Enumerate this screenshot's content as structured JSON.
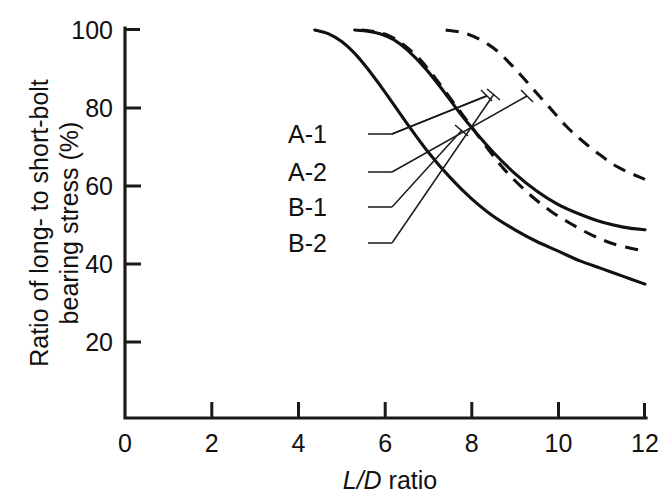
{
  "chart_data": {
    "type": "line",
    "title": "",
    "xlabel": "L/D ratio",
    "ylabel": "Ratio of long- to short-bolt bearing stress (%)",
    "ylabel_line1": "Ratio of long- to short-bolt",
    "ylabel_line2": "bearing stress (%)",
    "xlabel_italic_part": "L/D",
    "xlabel_plain_part": " ratio",
    "xlim": [
      0,
      12
    ],
    "ylim": [
      0,
      100
    ],
    "xticks": [
      0,
      2,
      4,
      6,
      8,
      10,
      12
    ],
    "xtick_labels": [
      "0",
      "2",
      "4",
      "6",
      "8",
      "10",
      "12"
    ],
    "yticks": [
      20,
      40,
      60,
      80,
      100
    ],
    "ytick_labels": [
      "20",
      "40",
      "60",
      "80",
      "100"
    ],
    "grid": false,
    "legend_position": "inside-left-callouts",
    "line_color": "#111111",
    "axis_color": "#1a1a1a",
    "series": [
      {
        "name": "A-1",
        "style": "solid",
        "points": [
          [
            4.38,
            100
          ],
          [
            4.7,
            99.0
          ],
          [
            5.0,
            97.0
          ],
          [
            5.3,
            94.0
          ],
          [
            5.6,
            90.0
          ],
          [
            6.0,
            84.0
          ],
          [
            6.5,
            76.0
          ],
          [
            7.0,
            68.5
          ],
          [
            7.5,
            62.0
          ],
          [
            8.0,
            56.5
          ],
          [
            8.5,
            52.0
          ],
          [
            9.0,
            48.5
          ],
          [
            9.5,
            45.5
          ],
          [
            10.0,
            43.0
          ],
          [
            10.5,
            40.5
          ],
          [
            11.0,
            38.5
          ],
          [
            11.5,
            36.5
          ],
          [
            12.0,
            34.5
          ]
        ]
      },
      {
        "name": "A-2",
        "style": "solid",
        "points": [
          [
            5.3,
            100
          ],
          [
            5.6,
            99.7
          ],
          [
            5.9,
            99.0
          ],
          [
            6.2,
            97.5
          ],
          [
            6.5,
            95.0
          ],
          [
            6.9,
            90.5
          ],
          [
            7.3,
            85.0
          ],
          [
            7.7,
            79.0
          ],
          [
            8.1,
            73.5
          ],
          [
            8.5,
            68.5
          ],
          [
            9.0,
            63.0
          ],
          [
            9.5,
            58.5
          ],
          [
            10.0,
            55.0
          ],
          [
            10.5,
            52.5
          ],
          [
            11.0,
            50.5
          ],
          [
            11.5,
            49.2
          ],
          [
            12.0,
            48.5
          ]
        ]
      },
      {
        "name": "B-1",
        "style": "dashed",
        "points": [
          [
            5.45,
            100
          ],
          [
            5.8,
            99.5
          ],
          [
            6.1,
            98.5
          ],
          [
            6.4,
            96.5
          ],
          [
            6.8,
            92.5
          ],
          [
            7.2,
            87.0
          ],
          [
            7.6,
            81.0
          ],
          [
            8.0,
            75.0
          ],
          [
            8.4,
            69.0
          ],
          [
            8.8,
            63.5
          ],
          [
            9.3,
            58.0
          ],
          [
            9.8,
            53.5
          ],
          [
            10.3,
            50.0
          ],
          [
            10.8,
            47.0
          ],
          [
            11.3,
            44.8
          ],
          [
            12.0,
            43.0
          ]
        ]
      },
      {
        "name": "B-2",
        "style": "dashed",
        "points": [
          [
            7.4,
            100
          ],
          [
            7.8,
            99.3
          ],
          [
            8.2,
            97.5
          ],
          [
            8.6,
            94.5
          ],
          [
            9.0,
            90.0
          ],
          [
            9.4,
            85.0
          ],
          [
            9.8,
            80.0
          ],
          [
            10.2,
            75.0
          ],
          [
            10.6,
            71.0
          ],
          [
            11.0,
            67.5
          ],
          [
            11.4,
            64.5
          ],
          [
            12.0,
            61.5
          ]
        ]
      }
    ],
    "callouts": [
      {
        "label": "A-1",
        "label_x": 0.0,
        "label_y": 0.0,
        "target_series": "A-1"
      },
      {
        "label": "A-2",
        "label_x": 0.0,
        "label_y": 0.0,
        "target_series": "A-2"
      },
      {
        "label": "B-1",
        "label_x": 0.0,
        "label_y": 0.0,
        "target_series": "B-1"
      },
      {
        "label": "B-2",
        "label_x": 0.0,
        "label_y": 0.0,
        "target_series": "B-2"
      }
    ]
  },
  "labels": {
    "series_a1": "A-1",
    "series_a2": "A-2",
    "series_b1": "B-1",
    "series_b2": "B-2",
    "x_tick_0": "0",
    "x_tick_1": "2",
    "x_tick_2": "4",
    "x_tick_3": "6",
    "x_tick_4": "8",
    "x_tick_5": "10",
    "x_tick_6": "12",
    "y_tick_0": "20",
    "y_tick_1": "40",
    "y_tick_2": "60",
    "y_tick_3": "80",
    "y_tick_4": "100",
    "y_axis_line1": "Ratio of long- to short-bolt",
    "y_axis_line2": "bearing stress (%)",
    "x_axis_italic": "L/D",
    "x_axis_rest": " ratio"
  }
}
